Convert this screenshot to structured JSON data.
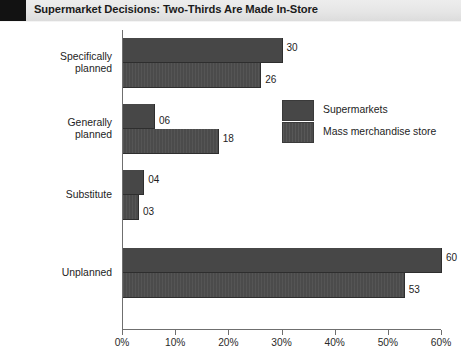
{
  "titlebar": {
    "title": "Supermarket Decisions: Two-Thirds Are Made In-Store",
    "corner_block_icon": "dark-square-block"
  },
  "chart_data": {
    "type": "bar",
    "orientation": "horizontal",
    "title": "Supermarket Decisions: Two-Thirds Are Made In-Store",
    "xlabel": "",
    "ylabel": "",
    "xlim": [
      0,
      60
    ],
    "xtick_labels": [
      "0%",
      "10%",
      "20%",
      "30%",
      "40%",
      "50%",
      "60%"
    ],
    "xtick_values": [
      0,
      10,
      20,
      30,
      40,
      50,
      60
    ],
    "grid": false,
    "legend_position": "center-right",
    "categories": [
      "Specifically\nplanned",
      "Generally\nplanned",
      "Substitute",
      "Unplanned"
    ],
    "series": [
      {
        "name": "Supermarkets",
        "values": [
          30,
          6,
          4,
          60
        ],
        "value_labels": [
          "30",
          "06",
          "04",
          "60"
        ],
        "color": "#474747"
      },
      {
        "name": "Mass merchandise store",
        "values": [
          26,
          18,
          3,
          53
        ],
        "value_labels": [
          "26",
          "18",
          "03",
          "53"
        ],
        "color": "#4b4b4b"
      }
    ]
  },
  "legend": {
    "items": [
      {
        "label": "Supermarkets",
        "swatch": "solid-dark-gray-swatch"
      },
      {
        "label": "Mass merchandise store",
        "swatch": "textured-dark-gray-swatch"
      }
    ]
  }
}
